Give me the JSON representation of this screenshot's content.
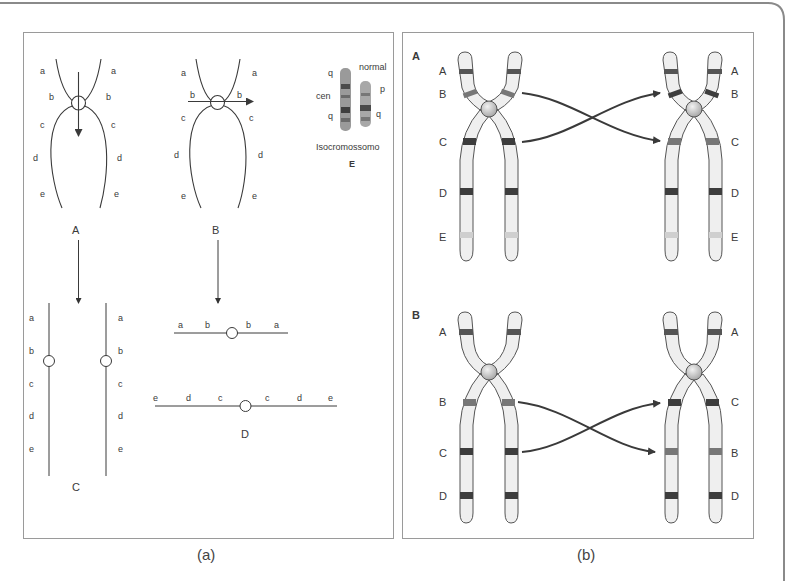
{
  "figure": {
    "captions": {
      "a": "(a)",
      "b": "(b)"
    },
    "panel_a": {
      "diagram_A": {
        "label": "A",
        "left_loci": [
          "a",
          "b",
          "c",
          "d",
          "e"
        ],
        "right_loci": [
          "a",
          "b",
          "c",
          "d",
          "e"
        ]
      },
      "diagram_B": {
        "label": "B",
        "left_loci": [
          "a",
          "b",
          "c",
          "d",
          "e"
        ],
        "right_loci": [
          "a",
          "b",
          "c",
          "d",
          "e"
        ]
      },
      "diagram_C": {
        "label": "C",
        "left_loci": [
          "a",
          "b",
          "c",
          "d",
          "e"
        ],
        "right_loci": [
          "a",
          "b",
          "c",
          "d",
          "e"
        ]
      },
      "diagram_AB_line": {
        "loci": [
          "a",
          "b",
          "b",
          "a"
        ]
      },
      "diagram_D": {
        "label": "D",
        "loci": [
          "e",
          "d",
          "c",
          "c",
          "d",
          "e"
        ]
      },
      "diagram_E": {
        "label": "E",
        "caption": "Isocromossomo",
        "normal_label": "normal",
        "q_top": "q",
        "cen": "cen",
        "q_bottom": "q",
        "p": "p",
        "q_normal": "q"
      }
    },
    "panel_b": {
      "section_A": {
        "label": "A",
        "left_bands": [
          "A",
          "B",
          "C",
          "D",
          "E"
        ],
        "right_bands": [
          "A",
          "B",
          "C",
          "D",
          "E"
        ]
      },
      "section_B": {
        "label": "B",
        "left_bands": [
          "A",
          "B",
          "C",
          "D"
        ],
        "right_bands": [
          "A",
          "C",
          "B",
          "D"
        ]
      }
    },
    "colors": {
      "line": "#3a3a3a",
      "chromatid_fill": "#eeeeee",
      "band_dark": "#3d3d3d",
      "band_mid": "#6f6f6f",
      "band_light": "#c8c8c8",
      "centromere": "#c9c9c9",
      "arrow": "#3a3a3a",
      "frame": "#8a8a8a"
    }
  }
}
